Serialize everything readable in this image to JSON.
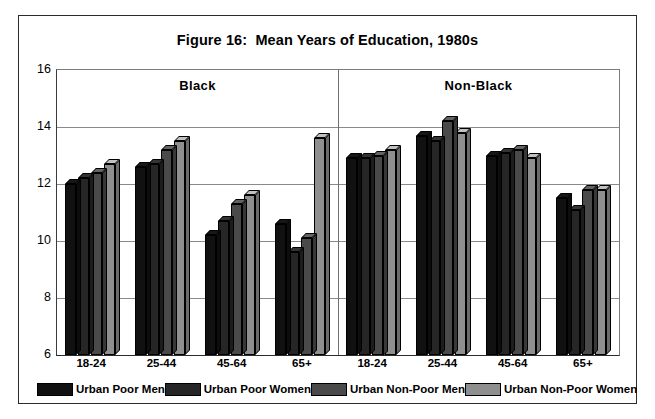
{
  "figure": {
    "title": "Figure 16:  Mean Years of Education, 1980s"
  },
  "axis": {
    "y_ticks": [
      "16",
      "14",
      "12",
      "10",
      "8",
      "6"
    ],
    "y_min": 6,
    "y_max": 16
  },
  "panels": [
    {
      "label": "Black"
    },
    {
      "label": "Non-Black"
    }
  ],
  "legend": [
    {
      "label": "Urban Poor Men",
      "color": "#111111"
    },
    {
      "label": "Urban Poor Women",
      "color": "#262626"
    },
    {
      "label": "Urban Non-Poor Men",
      "color": "#4a4a4a"
    },
    {
      "label": "Urban Non-Poor Women",
      "color": "#8f8f8f"
    }
  ],
  "chart_data": {
    "type": "bar",
    "title": "Figure 16:  Mean Years of Education, 1980s",
    "xlabel": "",
    "ylabel": "",
    "ylim": [
      6,
      16
    ],
    "ytick_step": 2,
    "grid": true,
    "legend_position": "bottom",
    "panels": [
      "Black",
      "Non-Black"
    ],
    "categories": [
      "18-24",
      "25-44",
      "45-64",
      "65+",
      "18-24",
      "25-44",
      "45-64",
      "65+"
    ],
    "category_panel": [
      "Black",
      "Black",
      "Black",
      "Black",
      "Non-Black",
      "Non-Black",
      "Non-Black",
      "Non-Black"
    ],
    "series": [
      {
        "name": "Urban Poor Men",
        "color": "#111111",
        "values": [
          12.0,
          12.6,
          10.2,
          10.6,
          12.9,
          13.7,
          13.0,
          11.5
        ]
      },
      {
        "name": "Urban Poor Women",
        "color": "#262626",
        "values": [
          12.2,
          12.7,
          10.7,
          9.6,
          12.9,
          13.5,
          13.1,
          11.1
        ]
      },
      {
        "name": "Urban Non-Poor Men",
        "color": "#4a4a4a",
        "values": [
          12.4,
          13.2,
          11.3,
          10.1,
          13.0,
          14.2,
          13.2,
          11.8
        ]
      },
      {
        "name": "Urban Non-Poor Women",
        "color": "#8f8f8f",
        "values": [
          12.7,
          13.5,
          11.6,
          13.6,
          13.2,
          13.8,
          12.9,
          11.8
        ]
      }
    ]
  }
}
